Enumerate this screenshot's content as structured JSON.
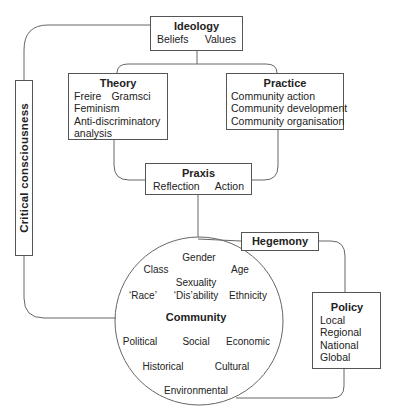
{
  "ideology": {
    "title": "Ideology",
    "items": [
      "Beliefs",
      "Values"
    ]
  },
  "theory": {
    "title": "Theory",
    "items": [
      "Freire",
      "Gramsci",
      "Feminism",
      "Anti-discriminatory",
      "analysis"
    ]
  },
  "practice": {
    "title": "Practice",
    "items": [
      "Community action",
      "Community development",
      "Community organisation"
    ]
  },
  "praxis": {
    "title": "Praxis",
    "items": [
      "Reflection",
      "Action"
    ]
  },
  "critical_consciousness": {
    "label": "Critical consciousness"
  },
  "hegemony": {
    "title": "Hegemony"
  },
  "policy": {
    "title": "Policy",
    "items": [
      "Local",
      "Regional",
      "National",
      "Global"
    ]
  },
  "community": {
    "title": "Community",
    "identity_factors": [
      "Gender",
      "Class",
      "Age",
      "Sexuality",
      "‘Race’",
      "‘Dis’ability",
      "Ethnicity"
    ],
    "context_factors": [
      "Political",
      "Social",
      "Economic",
      "Historical",
      "Cultural",
      "Environmental"
    ]
  },
  "colors": {
    "line": "#555555",
    "text": "#222222",
    "background": "#ffffff"
  }
}
